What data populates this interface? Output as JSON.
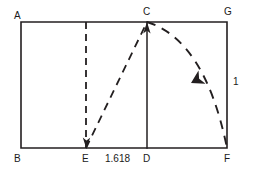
{
  "figure": {
    "stroke_color": "#231f20",
    "background_color": "#ffffff",
    "solid_stroke_width": 1.6,
    "dashed_stroke_width": 1.8,
    "dash_pattern": "7 5"
  },
  "vertices": {
    "A": {
      "label": "A",
      "x": 21,
      "y": 22
    },
    "B": {
      "label": "B",
      "x": 21,
      "y": 148
    },
    "C": {
      "label": "C",
      "x": 147,
      "y": 22
    },
    "D": {
      "label": "D",
      "x": 147,
      "y": 148
    },
    "E": {
      "label": "E",
      "x": 86,
      "y": 148
    },
    "F": {
      "label": "F",
      "x": 227,
      "y": 148
    },
    "G": {
      "label": "G",
      "x": 227,
      "y": 22
    }
  },
  "measurements": {
    "width_label": "1.618",
    "height_label": "1"
  },
  "shapes": {
    "outer_rectangle": "M 21 22 L 227 22 L 227 148 L 21 148 Z",
    "divider_CD": "M 147 22 L 147 148",
    "dashed_vertical_AE": "M 86 22 L 86 148",
    "dashed_diagonal_EC": "M 86 148 L 147 22",
    "dashed_arc_CF": "M 147 22 Q 205 40 227 148"
  },
  "annotations": {
    "arrow_up_at_C": "Arrowhead on diagonal pointing up toward C",
    "arrow_down_at_E": "Arrowhead on diagonal pointing down toward E",
    "arrow_on_arc": "Arrowhead on arc pointing down-right toward F"
  }
}
